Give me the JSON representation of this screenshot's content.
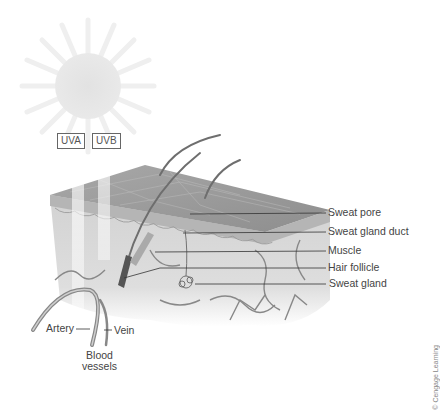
{
  "diagram": {
    "radiation_labels": [
      "UVA",
      "UVB"
    ],
    "structure_labels": [
      "Sweat pore",
      "Sweat gland duct",
      "Muscle",
      "Hair follicle",
      "Sweat gland"
    ],
    "vessel_labels": {
      "artery": "Artery",
      "vein": "Vein",
      "group": "Blood vessels",
      "group_line1": "Blood",
      "group_line2": "vessels"
    },
    "credit": "© Cengage Learning",
    "colors": {
      "sun": "#e4e4e4",
      "skin_top": "#9a9a9a",
      "skin_side": "#cfcfcf",
      "dermis": "#dcdcdc",
      "line": "#333333",
      "vessel": "#777777"
    }
  }
}
